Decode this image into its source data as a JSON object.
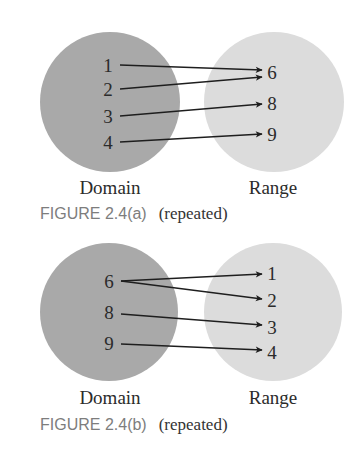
{
  "colors": {
    "domain_fill": "#a9a9a9",
    "range_fill": "#dcdcdc",
    "arrow": "#1e1e1e",
    "figure_label": "#7d7d7d",
    "text": "#2b2b2b"
  },
  "figures": [
    {
      "id": "a",
      "domain_label": "Domain",
      "range_label": "Range",
      "caption_figure": "FIGURE 2.4(a)",
      "caption_note": "(repeated)",
      "domain": [
        "1",
        "2",
        "3",
        "4"
      ],
      "range": [
        "6",
        "8",
        "9"
      ],
      "mapping": [
        {
          "from": "1",
          "to": "6"
        },
        {
          "from": "2",
          "to": "6"
        },
        {
          "from": "3",
          "to": "8"
        },
        {
          "from": "4",
          "to": "9"
        }
      ]
    },
    {
      "id": "b",
      "domain_label": "Domain",
      "range_label": "Range",
      "caption_figure": "FIGURE 2.4(b)",
      "caption_note": "(repeated)",
      "domain": [
        "6",
        "8",
        "9"
      ],
      "range": [
        "1",
        "2",
        "3",
        "4"
      ],
      "mapping": [
        {
          "from": "6",
          "to": "1"
        },
        {
          "from": "6",
          "to": "2"
        },
        {
          "from": "8",
          "to": "3"
        },
        {
          "from": "9",
          "to": "4"
        }
      ]
    }
  ]
}
